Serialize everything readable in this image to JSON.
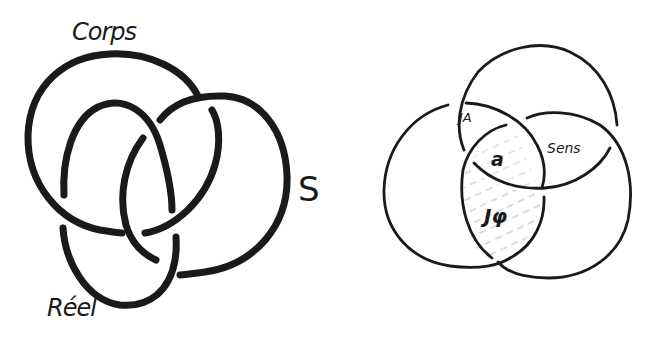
{
  "figure": {
    "type": "hand-drawn diagram",
    "background": "#ffffff",
    "ink_color": "#1a1a1a"
  },
  "left_diagram": {
    "name": "borromean-knot",
    "labels": {
      "corps": "Corps",
      "symbolic": "S",
      "real": "Réel"
    },
    "rings": [
      "Corps",
      "S",
      "Réel"
    ]
  },
  "right_diagram": {
    "name": "flattened-borromean-knot",
    "labels": {
      "jouissance_other": "JA",
      "object_a": "a",
      "sens": "Sens",
      "phallic_jouissance": "Jφ"
    },
    "shaded_region": "Jφ",
    "hatch_color": "#b8b8b8"
  }
}
